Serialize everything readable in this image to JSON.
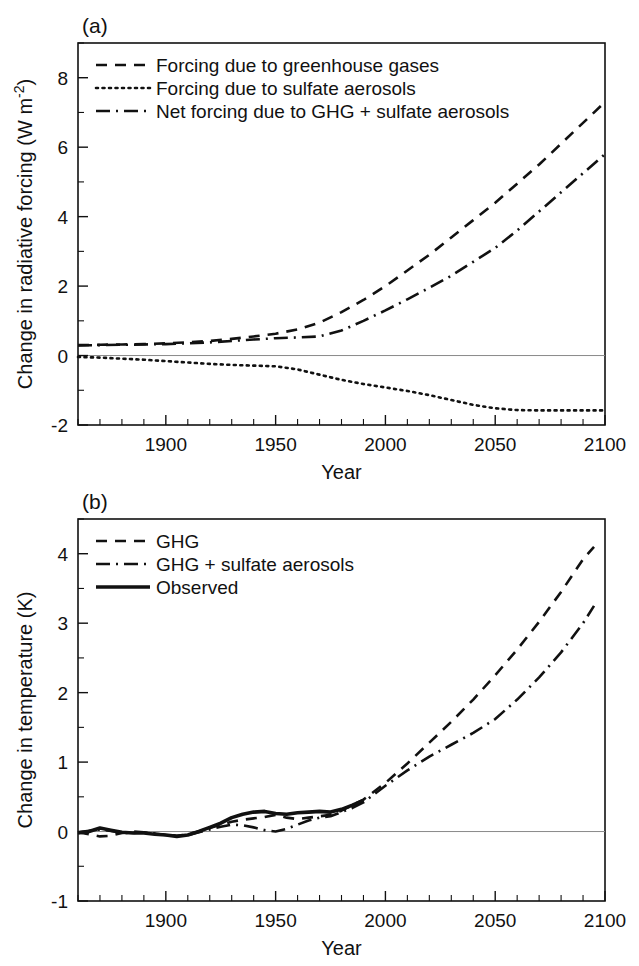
{
  "figure": {
    "background_color": "#ffffff",
    "line_color": "#111111",
    "zero_line_color": "#8a8a8a"
  },
  "panel_a": {
    "label": "(a)",
    "xlabel": "Year",
    "ylabel": "Change in radiative forcing (W m",
    "ylabel_exponent": "-2",
    "ylabel_close": ")",
    "legend": [
      {
        "label": "Forcing due to greenhouse gases",
        "style": "dashed"
      },
      {
        "label": "Forcing due to sulfate aerosols",
        "style": "dotted"
      },
      {
        "label": "Net forcing due to GHG + sulfate aerosols",
        "style": "dashdot"
      }
    ],
    "xticks": [
      1900,
      1950,
      2000,
      2050,
      2100
    ],
    "xtick_labels": [
      "1900",
      "1950",
      "2000",
      "2050",
      "2100"
    ],
    "yticks": [
      -2,
      0,
      2,
      4,
      6,
      8
    ],
    "ytick_labels": [
      "-2",
      "0",
      "2",
      "4",
      "6",
      "8"
    ]
  },
  "panel_b": {
    "label": "(b)",
    "xlabel": "Year",
    "ylabel": "Change in temperature (K)",
    "legend": [
      {
        "label": "GHG",
        "style": "dashed"
      },
      {
        "label": "GHG + sulfate aerosols",
        "style": "dashdot"
      },
      {
        "label": "Observed",
        "style": "solid"
      }
    ],
    "xticks": [
      1900,
      1950,
      2000,
      2050,
      2100
    ],
    "xtick_labels": [
      "1900",
      "1950",
      "2000",
      "2050",
      "2100"
    ],
    "yticks": [
      -1,
      0,
      1,
      2,
      3,
      4
    ],
    "ytick_labels": [
      "-1",
      "0",
      "1",
      "2",
      "3",
      "4"
    ]
  },
  "chart_data": [
    {
      "type": "line",
      "id": "panel-a",
      "title": "(a)",
      "xlabel": "Year",
      "ylabel": "Change in radiative forcing (W m-2)",
      "xlim": [
        1860,
        2100
      ],
      "ylim": [
        -2,
        9
      ],
      "grid": false,
      "legend_position": "top-left",
      "xticks": [
        1900,
        1950,
        2000,
        2050,
        2100
      ],
      "yticks": [
        -2,
        0,
        2,
        4,
        6,
        8
      ],
      "x": [
        1860,
        1870,
        1880,
        1890,
        1900,
        1910,
        1920,
        1930,
        1940,
        1950,
        1960,
        1970,
        1980,
        1990,
        2000,
        2010,
        2020,
        2030,
        2040,
        2050,
        2060,
        2070,
        2080,
        2090,
        2100
      ],
      "series": [
        {
          "name": "Forcing due to greenhouse gases",
          "style": "dashed",
          "values": [
            0.3,
            0.31,
            0.32,
            0.33,
            0.35,
            0.38,
            0.42,
            0.48,
            0.55,
            0.63,
            0.75,
            0.95,
            1.25,
            1.6,
            2.0,
            2.45,
            2.9,
            3.4,
            3.9,
            4.4,
            4.95,
            5.5,
            6.1,
            6.7,
            7.3
          ]
        },
        {
          "name": "Forcing due to sulfate aerosols",
          "style": "dotted",
          "values": [
            -0.04,
            -0.06,
            -0.09,
            -0.12,
            -0.16,
            -0.2,
            -0.24,
            -0.27,
            -0.29,
            -0.31,
            -0.4,
            -0.55,
            -0.7,
            -0.82,
            -0.92,
            -1.02,
            -1.14,
            -1.28,
            -1.42,
            -1.52,
            -1.57,
            -1.58,
            -1.58,
            -1.58,
            -1.58
          ]
        },
        {
          "name": "Net forcing due to GHG + sulfate aerosols",
          "style": "dashdot",
          "values": [
            0.29,
            0.3,
            0.31,
            0.32,
            0.33,
            0.35,
            0.38,
            0.42,
            0.46,
            0.5,
            0.52,
            0.55,
            0.72,
            1.0,
            1.3,
            1.62,
            1.95,
            2.3,
            2.7,
            3.1,
            3.6,
            4.15,
            4.7,
            5.25,
            5.8
          ]
        }
      ]
    },
    {
      "type": "line",
      "id": "panel-b",
      "title": "(b)",
      "xlabel": "Year",
      "ylabel": "Change in temperature (K)",
      "xlim": [
        1860,
        2100
      ],
      "ylim": [
        -1,
        4.5
      ],
      "grid": false,
      "legend_position": "top-left",
      "xticks": [
        1900,
        1950,
        2000,
        2050,
        2100
      ],
      "yticks": [
        -1,
        0,
        1,
        2,
        3,
        4
      ],
      "series": [
        {
          "name": "GHG",
          "style": "dashed",
          "x": [
            1860,
            1865,
            1870,
            1875,
            1880,
            1885,
            1890,
            1895,
            1900,
            1905,
            1910,
            1915,
            1920,
            1925,
            1930,
            1935,
            1940,
            1945,
            1950,
            1955,
            1960,
            1965,
            1970,
            1975,
            1980,
            1985,
            1990,
            1995,
            2000,
            2010,
            2020,
            2030,
            2040,
            2050,
            2060,
            2070,
            2080,
            2090,
            2095
          ],
          "values": [
            -0.01,
            -0.04,
            -0.07,
            -0.06,
            -0.02,
            0.0,
            -0.01,
            -0.03,
            -0.05,
            -0.06,
            -0.04,
            0.0,
            0.05,
            0.1,
            0.14,
            0.17,
            0.19,
            0.21,
            0.24,
            0.2,
            0.18,
            0.2,
            0.22,
            0.24,
            0.3,
            0.38,
            0.46,
            0.58,
            0.7,
            0.98,
            1.28,
            1.58,
            1.9,
            2.25,
            2.62,
            3.02,
            3.45,
            3.92,
            4.1
          ]
        },
        {
          "name": "GHG + sulfate aerosols",
          "style": "dashdot",
          "x": [
            1860,
            1865,
            1870,
            1875,
            1880,
            1885,
            1890,
            1895,
            1900,
            1905,
            1910,
            1915,
            1920,
            1925,
            1930,
            1935,
            1940,
            1945,
            1950,
            1955,
            1960,
            1965,
            1970,
            1975,
            1980,
            1985,
            1990,
            1995,
            2000,
            2010,
            2020,
            2030,
            2040,
            2050,
            2060,
            2070,
            2080,
            2090,
            2095
          ],
          "values": [
            -0.01,
            0.01,
            0.03,
            0.01,
            -0.02,
            -0.02,
            -0.01,
            -0.03,
            -0.05,
            -0.06,
            -0.05,
            -0.01,
            0.03,
            0.07,
            0.1,
            0.09,
            0.06,
            0.02,
            0.0,
            0.04,
            0.1,
            0.16,
            0.2,
            0.22,
            0.28,
            0.34,
            0.42,
            0.54,
            0.66,
            0.88,
            1.08,
            1.25,
            1.42,
            1.62,
            1.9,
            2.22,
            2.58,
            3.0,
            3.25
          ]
        },
        {
          "name": "Observed",
          "style": "solid",
          "x": [
            1860,
            1865,
            1870,
            1875,
            1880,
            1885,
            1890,
            1895,
            1900,
            1905,
            1910,
            1915,
            1920,
            1925,
            1930,
            1935,
            1940,
            1945,
            1950,
            1955,
            1960,
            1965,
            1970,
            1975,
            1980,
            1985,
            1990
          ],
          "values": [
            -0.02,
            0.0,
            0.05,
            0.02,
            -0.01,
            -0.02,
            -0.02,
            -0.04,
            -0.05,
            -0.07,
            -0.05,
            0.0,
            0.06,
            0.12,
            0.2,
            0.25,
            0.28,
            0.29,
            0.26,
            0.25,
            0.27,
            0.28,
            0.29,
            0.28,
            0.32,
            0.38,
            0.45
          ]
        }
      ]
    }
  ]
}
